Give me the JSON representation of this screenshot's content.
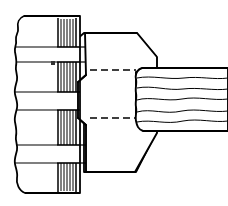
{
  "figure": {
    "title": "Technical Line Drawing",
    "canvas": {
      "width": 228,
      "height": 206
    },
    "colors": {
      "background": "#ffffff",
      "stroke": "#000000",
      "fill": "#ffffff",
      "hatch": "#1a1a1a"
    },
    "stroke_widths": {
      "outline": 1.8,
      "inner": 1.1,
      "hatch": 0.9,
      "hidden": 1.3
    },
    "parts": [
      {
        "id": "left-block",
        "name": "left-layered-block",
        "label": "Left block with torn edge",
        "edge_style": "jagged-torn",
        "band_count": 5,
        "band_lines_y": [
          47,
          62,
          92,
          110,
          145,
          163
        ],
        "bounds": {
          "x": 12,
          "y": 16,
          "width": 68,
          "height": 178
        }
      },
      {
        "id": "hatch-band",
        "name": "vertical-hatch-band",
        "label": "Vertical striped hatch band",
        "stripe_count": 7,
        "bounds": {
          "x": 57,
          "y": 18,
          "width": 19,
          "height": 175
        }
      },
      {
        "id": "center-body",
        "name": "center-polygon-body",
        "label": "Central polygonal body",
        "shape": "hexagonal-prism-profile",
        "bounds": {
          "x": 76,
          "y": 33,
          "width": 80,
          "height": 141
        }
      },
      {
        "id": "hidden-line-top",
        "name": "hidden-edge-line-top",
        "label": "Hidden edge (dashed) upper",
        "style": "dashed",
        "y": 70,
        "x_start": 90,
        "x_end": 136
      },
      {
        "id": "hidden-line-bottom",
        "name": "hidden-edge-line-bottom",
        "label": "Hidden edge (dashed) lower",
        "style": "dashed",
        "y": 118,
        "x_start": 90,
        "x_end": 136
      },
      {
        "id": "right-block",
        "name": "right-wavy-textured-block",
        "label": "Right block with wavy grain texture",
        "texture": "wavy-horizontal-grain",
        "wave_line_count": 5,
        "bounds": {
          "x": 136,
          "y": 68,
          "width": 92,
          "height": 62
        }
      }
    ],
    "annotations": [
      {
        "id": "mark-1",
        "name": "small-reference-mark",
        "label": "",
        "x": 52,
        "y": 63
      }
    ]
  }
}
